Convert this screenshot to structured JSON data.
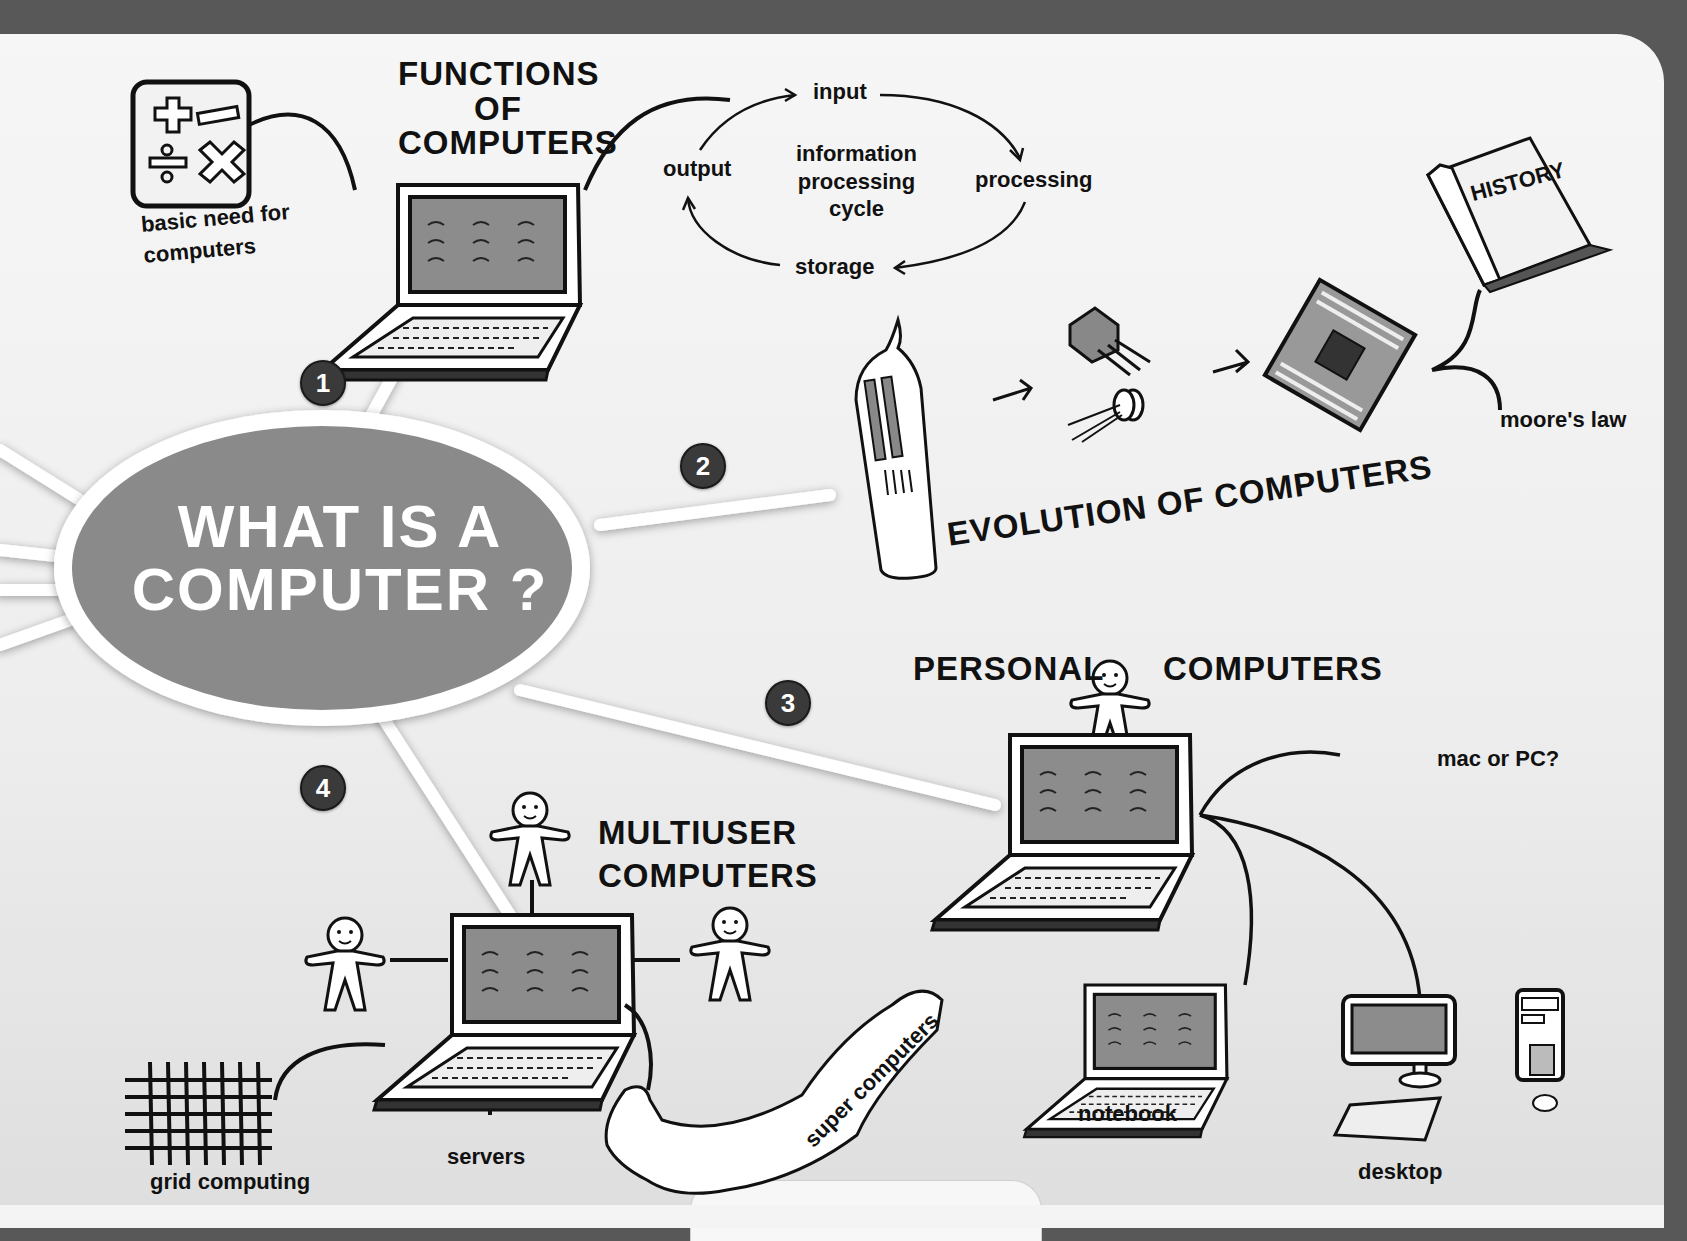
{
  "diagram": {
    "title_line1": "WHAT IS A",
    "title_line2": "COMPUTER ?",
    "branches": [
      {
        "number": "1",
        "title_lines": [
          "FUNCTIONS",
          "OF",
          "COMPUTERS"
        ]
      },
      {
        "number": "2",
        "title": "EVOLUTION OF COMPUTERS"
      },
      {
        "number": "3",
        "title_left": "PERSONAL",
        "title_right": "COMPUTERS"
      },
      {
        "number": "4",
        "title_lines": [
          "MULTIUSER",
          "COMPUTERS"
        ]
      }
    ],
    "functions": {
      "basic_need_line1": "basic need for",
      "basic_need_line2": "computers",
      "cycle": {
        "center_lines": [
          "information",
          "processing",
          "cycle"
        ],
        "steps": [
          "input",
          "processing",
          "storage",
          "output"
        ]
      }
    },
    "evolution": {
      "stages": [
        "vacuum tube",
        "transistor",
        "microprocessor"
      ],
      "history_book": "HISTORY",
      "moores_law": "moore's law"
    },
    "personal": {
      "question": "mac or PC?",
      "types": [
        "notebook",
        "desktop"
      ]
    },
    "multiuser": {
      "types": [
        "grid computing",
        "servers",
        "super computers"
      ]
    }
  },
  "colors": {
    "ellipse_fill": "#8a8a8a",
    "badge_fill": "#3a3a3a",
    "screen_fill": "#8c8c8c",
    "background_dark": "#585858"
  }
}
